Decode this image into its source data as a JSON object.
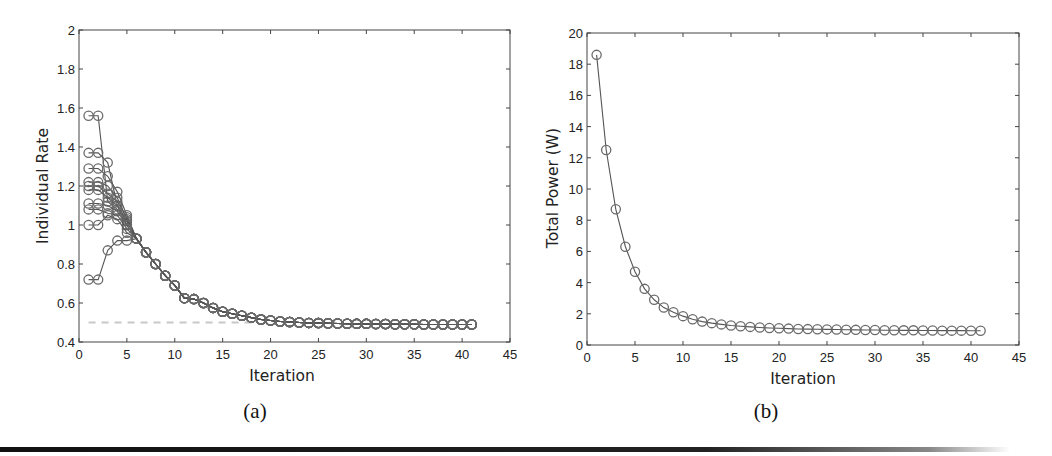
{
  "chart_data": [
    {
      "panel": "(a)",
      "type": "line",
      "title": "",
      "xlabel": "Iteration",
      "ylabel": "Individual Rate",
      "xlim": [
        0,
        45
      ],
      "ylim": [
        0.4,
        2
      ],
      "xticks": [
        0,
        5,
        10,
        15,
        20,
        25,
        30,
        35,
        40,
        45
      ],
      "yticks": [
        0.4,
        0.6,
        0.8,
        1,
        1.2,
        1.4,
        1.6,
        1.8,
        2
      ],
      "ytick_labels": [
        "0.4",
        "0.6",
        "0.8",
        "1",
        "1.2",
        "1.4",
        "1.6",
        "1.8",
        "2"
      ],
      "grid": false,
      "marker": "circle-open",
      "x": [
        1,
        2,
        3,
        4,
        5,
        6,
        7,
        8,
        9,
        10,
        11,
        12,
        13,
        14,
        15,
        16,
        17,
        18,
        19,
        20,
        21,
        22,
        23,
        24,
        25,
        26,
        27,
        28,
        29,
        30,
        31,
        32,
        33,
        34,
        35,
        36,
        37,
        38,
        39,
        40,
        41
      ],
      "common_tail_from_iteration_6": [
        0.93,
        0.86,
        0.8,
        0.74,
        0.69,
        0.625,
        0.62,
        0.6,
        0.575,
        0.555,
        0.545,
        0.535,
        0.525,
        0.515,
        0.51,
        0.505,
        0.503,
        0.5,
        0.498,
        0.497,
        0.496,
        0.495,
        0.494,
        0.493,
        0.493,
        0.492,
        0.492,
        0.491,
        0.491,
        0.491,
        0.49,
        0.49,
        0.49,
        0.49,
        0.49,
        0.49
      ],
      "series": [
        {
          "name": "user 1",
          "head": [
            1.56,
            1.56,
            1.12,
            1.08,
            1.02
          ]
        },
        {
          "name": "user 2",
          "head": [
            1.37,
            1.37,
            1.32,
            1.1,
            1.0
          ]
        },
        {
          "name": "user 3",
          "head": [
            1.29,
            1.29,
            1.25,
            1.17,
            1.05
          ]
        },
        {
          "name": "user 4",
          "head": [
            1.22,
            1.22,
            1.2,
            1.14,
            1.03
          ]
        },
        {
          "name": "user 5",
          "head": [
            1.2,
            1.2,
            1.16,
            1.12,
            1.04
          ]
        },
        {
          "name": "user 6",
          "head": [
            1.18,
            1.18,
            1.14,
            1.1,
            1.02
          ]
        },
        {
          "name": "user 7",
          "head": [
            1.11,
            1.11,
            1.1,
            1.07,
            1.0
          ]
        },
        {
          "name": "user 8",
          "head": [
            1.08,
            1.08,
            1.06,
            1.05,
            0.98
          ]
        },
        {
          "name": "user 9",
          "head": [
            1.0,
            1.0,
            1.05,
            1.03,
            0.96
          ]
        },
        {
          "name": "user 10",
          "head": [
            0.72,
            0.72,
            0.87,
            0.92,
            0.92
          ]
        }
      ],
      "reference_line": {
        "style": "dashed",
        "color": "#c8c8c8",
        "y": 0.5,
        "x_from": 1,
        "x_to": 18
      }
    },
    {
      "panel": "(b)",
      "type": "line",
      "title": "",
      "xlabel": "Iteration",
      "ylabel": "Total Power (W)",
      "xlim": [
        0,
        45
      ],
      "ylim": [
        0,
        20
      ],
      "xticks": [
        0,
        5,
        10,
        15,
        20,
        25,
        30,
        35,
        40,
        45
      ],
      "yticks": [
        0,
        2,
        4,
        6,
        8,
        10,
        12,
        14,
        16,
        18,
        20
      ],
      "grid": false,
      "marker": "circle-open",
      "x": [
        1,
        2,
        3,
        4,
        5,
        6,
        7,
        8,
        9,
        10,
        11,
        12,
        13,
        14,
        15,
        16,
        17,
        18,
        19,
        20,
        21,
        22,
        23,
        24,
        25,
        26,
        27,
        28,
        29,
        30,
        31,
        32,
        33,
        34,
        35,
        36,
        37,
        38,
        39,
        40,
        41
      ],
      "series": [
        {
          "name": "total power",
          "values": [
            18.6,
            12.5,
            8.7,
            6.3,
            4.7,
            3.6,
            2.9,
            2.4,
            2.1,
            1.85,
            1.65,
            1.5,
            1.4,
            1.32,
            1.25,
            1.2,
            1.16,
            1.12,
            1.09,
            1.07,
            1.05,
            1.03,
            1.02,
            1.01,
            1.0,
            0.99,
            0.98,
            0.97,
            0.96,
            0.96,
            0.95,
            0.95,
            0.94,
            0.94,
            0.93,
            0.93,
            0.92,
            0.92,
            0.92,
            0.91,
            0.91
          ]
        }
      ]
    }
  ],
  "captions": {
    "a": "(a)",
    "b": "(b)"
  },
  "colors": {
    "line": "#555555",
    "marker": "#6a6a6a",
    "axis": "#444444",
    "reference": "#c8c8c8"
  }
}
